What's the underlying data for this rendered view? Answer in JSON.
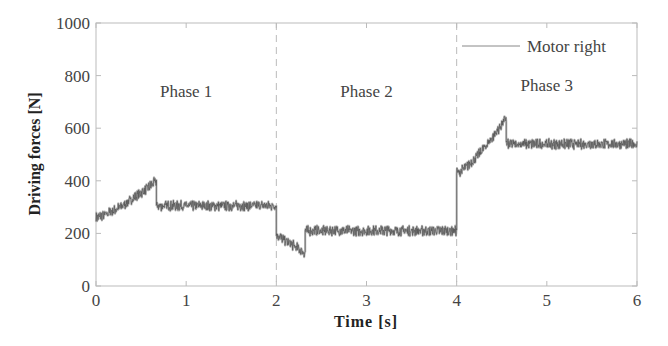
{
  "chart_data": {
    "type": "line",
    "title": "",
    "xlabel": "Time [s]",
    "ylabel": "Driving forces [N]",
    "xlim": [
      0,
      6
    ],
    "ylim": [
      0,
      1000
    ],
    "xticks": [
      0,
      1,
      2,
      3,
      4,
      5,
      6
    ],
    "yticks": [
      0,
      200,
      400,
      600,
      800,
      1000
    ],
    "grid": false,
    "legend": {
      "position": "upper right",
      "entries": [
        "Motor right"
      ]
    },
    "phase_boundaries": [
      2,
      4
    ],
    "annotations": [
      {
        "text": "Phase 1",
        "x": 1.0,
        "y": 720
      },
      {
        "text": "Phase 2",
        "x": 3.0,
        "y": 720
      },
      {
        "text": "Phase 3",
        "x": 5.0,
        "y": 740
      }
    ],
    "series": [
      {
        "name": "Motor right",
        "noise_amplitude_N": 15,
        "segments": [
          {
            "t_start": 0.0,
            "t_end": 0.67,
            "f_start": 260,
            "f_end": 400,
            "shape": "rising-curve"
          },
          {
            "t_start": 0.67,
            "t_end": 2.0,
            "f_start": 305,
            "f_end": 305,
            "shape": "flat"
          },
          {
            "t_start": 2.0,
            "t_end": 2.32,
            "f_start": 195,
            "f_end": 125,
            "shape": "falling"
          },
          {
            "t_start": 2.32,
            "t_end": 4.0,
            "f_start": 210,
            "f_end": 210,
            "shape": "flat"
          },
          {
            "t_start": 4.0,
            "t_end": 4.55,
            "f_start": 430,
            "f_end": 640,
            "shape": "rising-curve"
          },
          {
            "t_start": 4.55,
            "t_end": 6.0,
            "f_start": 540,
            "f_end": 540,
            "shape": "flat"
          }
        ],
        "key_points": [
          {
            "t": 0.0,
            "f": 260
          },
          {
            "t": 0.67,
            "f": 400
          },
          {
            "t": 0.68,
            "f": 305
          },
          {
            "t": 2.0,
            "f": 305
          },
          {
            "t": 2.01,
            "f": 195
          },
          {
            "t": 2.32,
            "f": 125
          },
          {
            "t": 2.33,
            "f": 210
          },
          {
            "t": 4.0,
            "f": 210
          },
          {
            "t": 4.01,
            "f": 430
          },
          {
            "t": 4.55,
            "f": 640
          },
          {
            "t": 4.56,
            "f": 540
          },
          {
            "t": 6.0,
            "f": 540
          }
        ]
      }
    ]
  },
  "colors": {
    "axis": "#bbbbbb",
    "signal": "#555555",
    "boundary": "#bbbbbb"
  }
}
